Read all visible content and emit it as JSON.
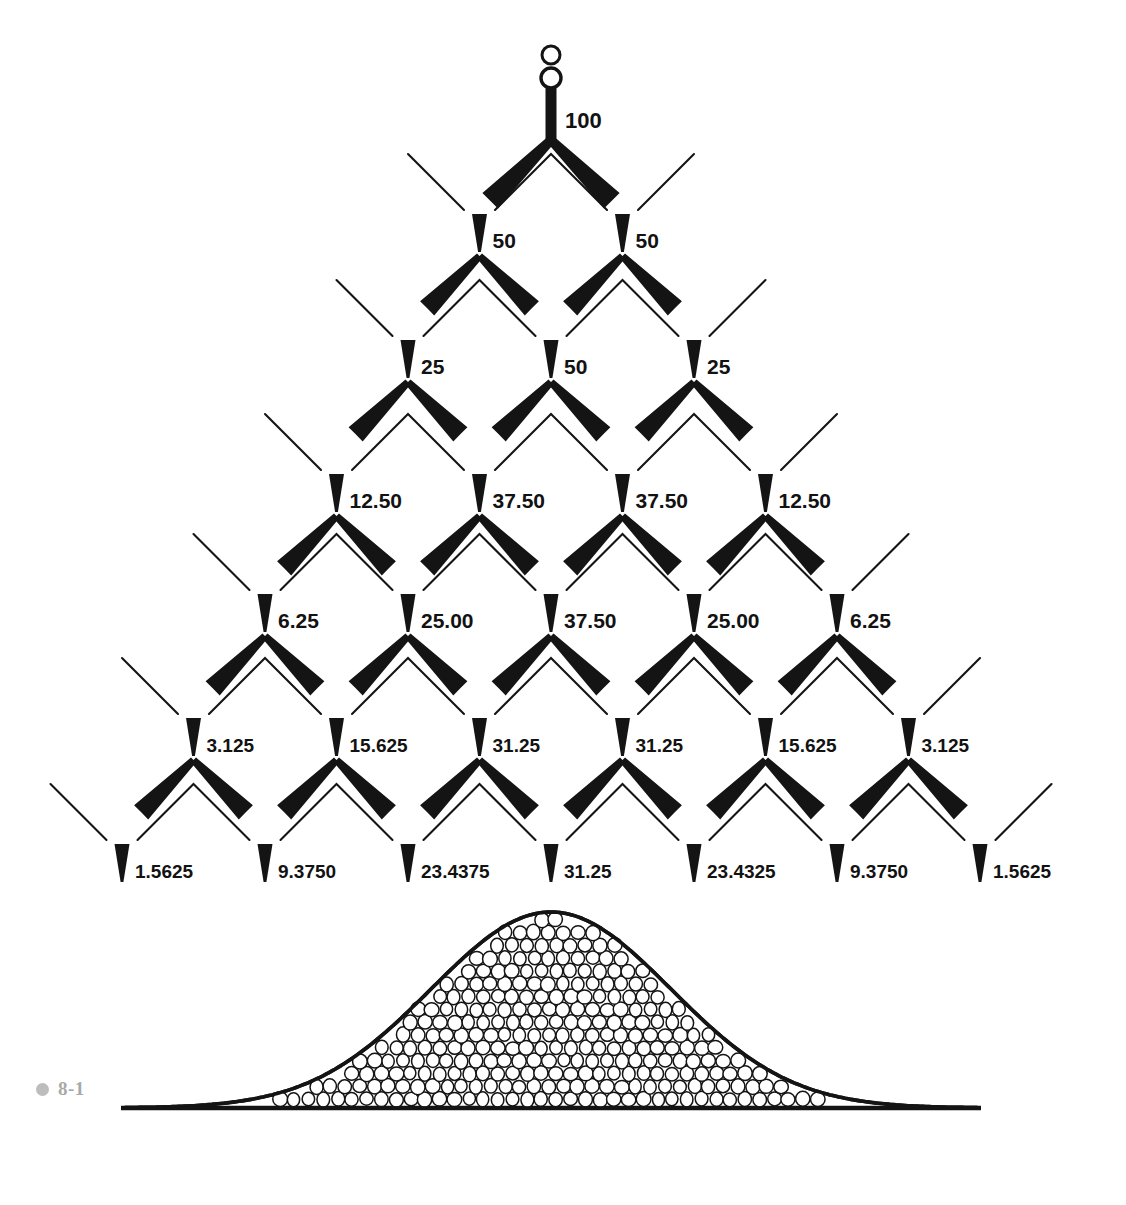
{
  "figure": {
    "caption_number": "8-1",
    "caption_dot_color": "#bdbdbd",
    "caption_text_color": "#a8a8a8",
    "ink_color": "#141414",
    "background_color": "#ffffff"
  },
  "chart_data": {
    "type": "diagram",
    "subtype": "binomial-probability-tree",
    "xlabel": "",
    "ylabel": "",
    "grid": false,
    "legend": "none",
    "units": "percent",
    "rows": [
      {
        "level": 0,
        "labels": [
          "100"
        ],
        "values": [
          100
        ]
      },
      {
        "level": 1,
        "labels": [
          "50",
          "50"
        ],
        "values": [
          50,
          50
        ]
      },
      {
        "level": 2,
        "labels": [
          "25",
          "50",
          "25"
        ],
        "values": [
          25,
          50,
          25
        ]
      },
      {
        "level": 3,
        "labels": [
          "12.50",
          "37.50",
          "37.50",
          "12.50"
        ],
        "values": [
          12.5,
          37.5,
          37.5,
          12.5
        ]
      },
      {
        "level": 4,
        "labels": [
          "6.25",
          "25.00",
          "37.50",
          "25.00",
          "6.25"
        ],
        "values": [
          6.25,
          25.0,
          37.5,
          25.0,
          6.25
        ]
      },
      {
        "level": 5,
        "labels": [
          "3.125",
          "15.625",
          "31.25",
          "31.25",
          "15.625",
          "3.125"
        ],
        "values": [
          3.125,
          15.625,
          31.25,
          31.25,
          15.625,
          3.125
        ]
      },
      {
        "level": 6,
        "labels": [
          "1.5625",
          "9.3750",
          "23.4375",
          "31.25",
          "23.4325",
          "9.3750",
          "1.5625"
        ],
        "values": [
          1.5625,
          9.375,
          23.4375,
          31.25,
          23.4325,
          9.375,
          1.5625
        ]
      }
    ],
    "distribution_curve": {
      "shape": "bell",
      "fill": "packed circular pellets",
      "baseline_label": "",
      "peak_position_fraction": 0.5,
      "profile": [
        0.02,
        0.03,
        0.05,
        0.09,
        0.17,
        0.32,
        0.55,
        0.8,
        0.96,
        1.0,
        0.96,
        0.8,
        0.55,
        0.32,
        0.17,
        0.09,
        0.05,
        0.03,
        0.02
      ]
    },
    "hopper": {
      "ball_count": 2,
      "description": "two pellets entering the funnel at the top"
    }
  }
}
